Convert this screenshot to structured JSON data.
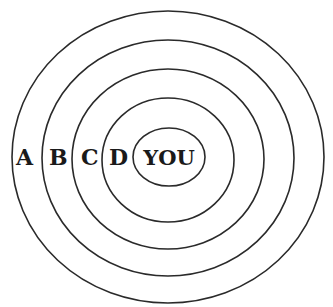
{
  "diagram": {
    "type": "concentric-ellipses",
    "center_label": "YOU",
    "rings": [
      {
        "label": "A",
        "cx": 168,
        "cy": 157,
        "rx": 156,
        "ry": 146
      },
      {
        "label": "B",
        "cx": 168,
        "cy": 158,
        "rx": 126,
        "ry": 118
      },
      {
        "label": "C",
        "cx": 168,
        "cy": 159,
        "rx": 96,
        "ry": 90
      },
      {
        "label": "D",
        "cx": 168,
        "cy": 160,
        "rx": 66,
        "ry": 62
      },
      {
        "label": "YOU",
        "cx": 168,
        "cy": 158,
        "rx": 36,
        "ry": 30
      }
    ],
    "stroke_color": "#2a2a2a",
    "label_color": "#1a1a1a"
  }
}
